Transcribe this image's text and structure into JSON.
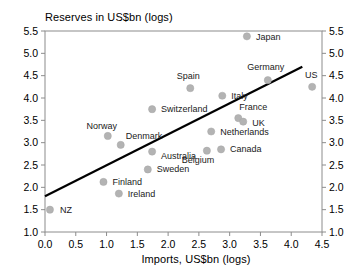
{
  "chart_data": {
    "type": "scatter",
    "title": "Reserves in US$bn (logs)",
    "xlabel": "Imports, US$bn (logs)",
    "ylabel": "Reserves in US$bn (logs)",
    "xlim": [
      0.0,
      4.5
    ],
    "ylim": [
      1.0,
      5.5
    ],
    "xticks": [
      "0.0",
      "0.5",
      "1.0",
      "1.5",
      "2.0",
      "2.5",
      "3.0",
      "3.5",
      "4.0",
      "4.5"
    ],
    "yticks": [
      "1.0",
      "1.5",
      "2.0",
      "2.5",
      "3.0",
      "3.5",
      "4.0",
      "4.5",
      "5.0",
      "5.5"
    ],
    "grid": false,
    "legend": "none",
    "right_axis": true,
    "marker_color": "#b3b3b3",
    "trendline_color": "#000000",
    "trendline": {
      "x0": 0.0,
      "y0": 1.8,
      "x1": 4.18,
      "y1": 4.7
    },
    "points": [
      {
        "label": "NZ",
        "x": 0.08,
        "y": 1.5,
        "lx": 10,
        "ly": 3
      },
      {
        "label": "Finland",
        "x": 0.95,
        "y": 2.12,
        "lx": 9,
        "ly": 3
      },
      {
        "label": "Ireland",
        "x": 1.2,
        "y": 1.86,
        "lx": 9,
        "ly": 3
      },
      {
        "label": "Norway",
        "x": 1.02,
        "y": 3.15,
        "lx": -6,
        "ly": -7
      },
      {
        "label": "Denmark",
        "x": 1.23,
        "y": 2.95,
        "lx": 5,
        "ly": -6
      },
      {
        "label": "Switzerland",
        "x": 1.74,
        "y": 3.75,
        "lx": 9,
        "ly": 3
      },
      {
        "label": "Australia",
        "x": 1.74,
        "y": 2.8,
        "lx": 9,
        "ly": 7
      },
      {
        "label": "Sweden",
        "x": 1.67,
        "y": 2.4,
        "lx": 9,
        "ly": 3
      },
      {
        "label": "Spain",
        "x": 2.36,
        "y": 4.22,
        "lx": -2,
        "ly": -9
      },
      {
        "label": "Belgium",
        "x": 2.63,
        "y": 2.82,
        "lx": -9,
        "ly": 12
      },
      {
        "label": "Canada",
        "x": 2.86,
        "y": 2.85,
        "lx": 9,
        "ly": 3
      },
      {
        "label": "Netherlands",
        "x": 2.7,
        "y": 3.25,
        "lx": 9,
        "ly": 3
      },
      {
        "label": "Italy",
        "x": 2.88,
        "y": 4.05,
        "lx": 9,
        "ly": 3
      },
      {
        "label": "France",
        "x": 3.14,
        "y": 3.55,
        "lx": 1,
        "ly": -8
      },
      {
        "label": "UK",
        "x": 3.22,
        "y": 3.47,
        "lx": 9,
        "ly": 4
      },
      {
        "label": "Germany",
        "x": 3.62,
        "y": 4.4,
        "lx": -2,
        "ly": -10
      },
      {
        "label": "Japan",
        "x": 3.28,
        "y": 5.38,
        "lx": 9,
        "ly": 4
      },
      {
        "label": "US",
        "x": 4.34,
        "y": 4.25,
        "lx": -1,
        "ly": -9
      }
    ]
  }
}
